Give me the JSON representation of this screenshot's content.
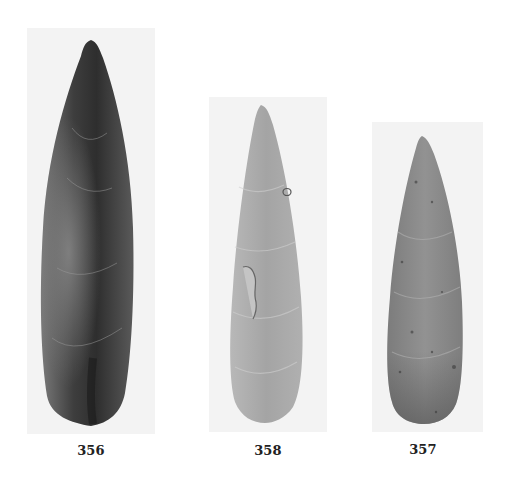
{
  "figure": {
    "specimens": [
      {
        "label": "356",
        "description": "dark flint lanceolate point",
        "tone": "#5a5a5a",
        "plate": {
          "x": 27,
          "y": 28,
          "w": 128,
          "h": 406
        },
        "caption_pos": {
          "x": 61,
          "y": 443
        }
      },
      {
        "label": "358",
        "description": "light gray lanceolate point",
        "tone": "#a9a9a9",
        "plate": {
          "x": 209,
          "y": 97,
          "w": 118,
          "h": 335
        },
        "caption_pos": {
          "x": 238,
          "y": 443
        }
      },
      {
        "label": "357",
        "description": "mottled gray lanceolate point",
        "tone": "#8a8a8a",
        "plate": {
          "x": 372,
          "y": 122,
          "w": 111,
          "h": 310
        },
        "caption_pos": {
          "x": 393,
          "y": 442
        }
      }
    ]
  }
}
